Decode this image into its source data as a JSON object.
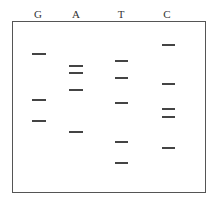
{
  "lanes": [
    {
      "label": "G",
      "x": 38,
      "band_x": [
        32,
        46
      ],
      "bands": [
        53,
        99,
        120
      ]
    },
    {
      "label": "A",
      "x": 76,
      "band_x": [
        69,
        83
      ],
      "bands": [
        65,
        72,
        89,
        131
      ]
    },
    {
      "label": "T",
      "x": 121,
      "band_x": [
        115,
        128
      ],
      "bands": [
        60,
        77,
        102,
        141,
        162
      ]
    },
    {
      "label": "C",
      "x": 167,
      "band_x": [
        162,
        175
      ],
      "bands": [
        44,
        83,
        108,
        116,
        147
      ]
    }
  ],
  "colors": {
    "band": "#444444",
    "border": "#555555",
    "label": "#333333"
  }
}
